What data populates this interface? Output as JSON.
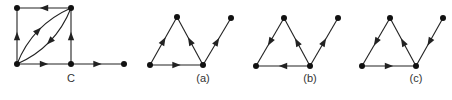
{
  "figure": {
    "graphs": [
      {
        "id": "C",
        "label": "C",
        "label_pos": [
          71,
          82
        ],
        "nodes": [
          {
            "id": "tl",
            "x": 17,
            "y": 8
          },
          {
            "id": "tr",
            "x": 71,
            "y": 8
          },
          {
            "id": "bl",
            "x": 17,
            "y": 64
          },
          {
            "id": "bm",
            "x": 71,
            "y": 64
          },
          {
            "id": "r",
            "x": 124,
            "y": 64
          }
        ],
        "edges": [
          {
            "from": "tr",
            "to": "tl",
            "type": "line"
          },
          {
            "from": "bl",
            "to": "tl",
            "type": "line"
          },
          {
            "from": "bl",
            "to": "bm",
            "type": "line"
          },
          {
            "from": "bm",
            "to": "tr",
            "type": "line"
          },
          {
            "from": "bm",
            "to": "r",
            "type": "line"
          },
          {
            "from": "bl",
            "to": "tr",
            "type": "curve",
            "bend": -1
          },
          {
            "from": "tr",
            "to": "bl",
            "type": "curve",
            "bend": -1
          }
        ]
      },
      {
        "id": "a",
        "label": "(a)",
        "label_pos": [
          203,
          82
        ],
        "nodes": [
          {
            "id": "l",
            "x": 150,
            "y": 65
          },
          {
            "id": "t",
            "x": 177,
            "y": 17
          },
          {
            "id": "b",
            "x": 203,
            "y": 65
          },
          {
            "id": "tr",
            "x": 231,
            "y": 18
          }
        ],
        "edges": [
          {
            "from": "l",
            "to": "t",
            "type": "line"
          },
          {
            "from": "l",
            "to": "b",
            "type": "line"
          },
          {
            "from": "b",
            "to": "t",
            "type": "line"
          },
          {
            "from": "b",
            "to": "tr",
            "type": "line"
          }
        ]
      },
      {
        "id": "b",
        "label": "(b)",
        "label_pos": [
          310,
          82
        ],
        "nodes": [
          {
            "id": "l",
            "x": 256,
            "y": 66
          },
          {
            "id": "t",
            "x": 284,
            "y": 18
          },
          {
            "id": "b",
            "x": 310,
            "y": 66
          },
          {
            "id": "tr",
            "x": 338,
            "y": 18
          }
        ],
        "edges": [
          {
            "from": "t",
            "to": "l",
            "type": "line"
          },
          {
            "from": "b",
            "to": "l",
            "type": "line"
          },
          {
            "from": "b",
            "to": "t",
            "type": "line"
          },
          {
            "from": "b",
            "to": "tr",
            "type": "line"
          }
        ]
      },
      {
        "id": "c",
        "label": "(c)",
        "label_pos": [
          416,
          82
        ],
        "nodes": [
          {
            "id": "l",
            "x": 362,
            "y": 66
          },
          {
            "id": "t",
            "x": 390,
            "y": 18
          },
          {
            "id": "b",
            "x": 416,
            "y": 66
          },
          {
            "id": "tr",
            "x": 443,
            "y": 18
          }
        ],
        "edges": [
          {
            "from": "t",
            "to": "l",
            "type": "line"
          },
          {
            "from": "l",
            "to": "b",
            "type": "line"
          },
          {
            "from": "b",
            "to": "t",
            "type": "line"
          },
          {
            "from": "tr",
            "to": "b",
            "type": "line"
          }
        ]
      }
    ],
    "colors": {
      "edge": "#222222",
      "node": "#111111",
      "label": "#333333"
    }
  }
}
